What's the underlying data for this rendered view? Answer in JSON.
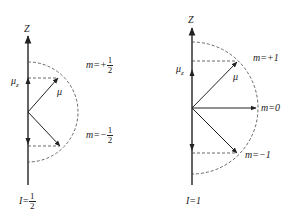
{
  "diagrams": [
    {
      "id": "spin-half",
      "axis_label": "Z",
      "mu_label": "μ",
      "mu_z_label": "μ",
      "mu_z_sub": "z",
      "states": [
        {
          "m_prefix": "m=+",
          "num": "1",
          "den": "2"
        },
        {
          "m_prefix": "m=−",
          "num": "1",
          "den": "2"
        }
      ],
      "spin_prefix": "I=",
      "spin_num": "1",
      "spin_den": "2"
    },
    {
      "id": "spin-one",
      "axis_label": "Z",
      "mu_label": "μ",
      "mu_z_label": "μ",
      "mu_z_sub": "z",
      "states": [
        {
          "m_label": "m=+1"
        },
        {
          "m_label": "m=0"
        },
        {
          "m_label": "m=−1"
        }
      ],
      "spin_label": "I=1"
    }
  ],
  "colors": {
    "line": "#222222",
    "dashed": "#444444",
    "background": "#ffffff"
  }
}
